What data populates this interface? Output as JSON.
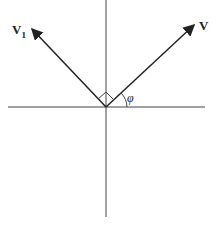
{
  "diagram": {
    "labels": {
      "v1_main": "V",
      "v1_sub": "1",
      "v": "V",
      "phi": "φ"
    },
    "colors": {
      "line": "#333333",
      "background": "#ffffff"
    }
  }
}
